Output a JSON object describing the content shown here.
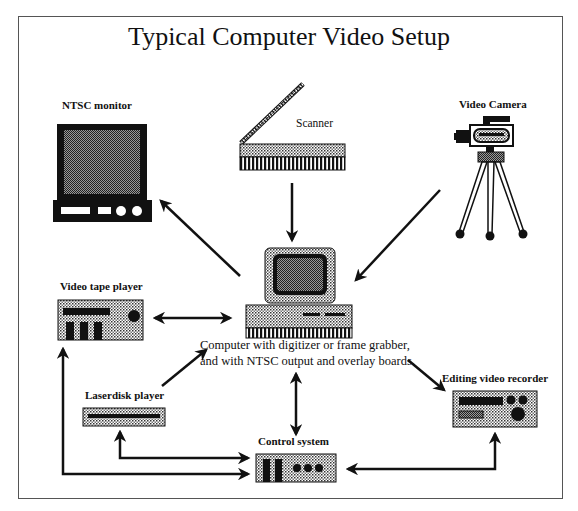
{
  "title": "Typical Computer Video Setup",
  "nodes": {
    "ntsc_monitor": {
      "label": "NTSC monitor"
    },
    "scanner": {
      "label": "Scanner"
    },
    "video_camera": {
      "label": "Video Camera"
    },
    "computer": {
      "label_line1": "Computer with digitizer or frame grabber,",
      "label_line2": "and with NTSC output and overlay boards."
    },
    "video_tape_player": {
      "label": "Video tape player"
    },
    "laserdisk_player": {
      "label": "Laserdisk player"
    },
    "control_system": {
      "label": "Control system"
    },
    "editing_video_recorder": {
      "label": "Editing video recorder"
    }
  },
  "edges": [
    {
      "from": "computer",
      "to": "ntsc_monitor",
      "direction": "one-way"
    },
    {
      "from": "scanner",
      "to": "computer",
      "direction": "one-way"
    },
    {
      "from": "video_camera",
      "to": "computer",
      "direction": "one-way"
    },
    {
      "from": "computer",
      "to": "video_tape_player",
      "direction": "two-way"
    },
    {
      "from": "laserdisk_player",
      "to": "computer",
      "direction": "one-way"
    },
    {
      "from": "computer",
      "to": "editing_video_recorder",
      "direction": "one-way"
    },
    {
      "from": "computer",
      "to": "control_system",
      "direction": "two-way"
    },
    {
      "from": "control_system",
      "to": "laserdisk_player",
      "direction": "two-way"
    },
    {
      "from": "control_system",
      "to": "video_tape_player",
      "direction": "two-way"
    },
    {
      "from": "control_system",
      "to": "editing_video_recorder",
      "direction": "two-way"
    }
  ],
  "colors": {
    "ink": "#111111",
    "stipple_light": "#bdbdbd",
    "stipple_dark": "#6a6a6a",
    "frame": "#555555"
  }
}
